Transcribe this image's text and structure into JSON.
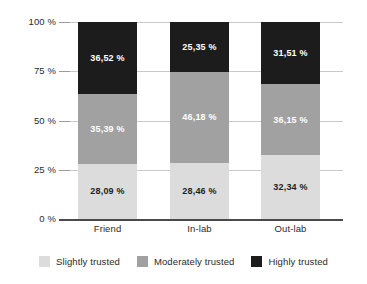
{
  "chart_data": {
    "type": "bar",
    "subtype": "stacked-bar-100-percent",
    "title": "",
    "xlabel": "",
    "ylabel": "",
    "categories": [
      "Friend",
      "In-lab",
      "Out-lab"
    ],
    "ylim": [
      0,
      100
    ],
    "ytick_labels": [
      "100 %",
      "75 %",
      "50 %",
      "25 %",
      "0 %"
    ],
    "ytick_values": [
      100,
      75,
      50,
      25,
      0
    ],
    "grid": true,
    "legend_position": "bottom",
    "series": [
      {
        "name": "Slightly trusted",
        "color": "#dcdcdc",
        "label_color": "#1e1e1e",
        "values": [
          28.09,
          28.46,
          32.34
        ],
        "data_labels": [
          "28,09 %",
          "28,46 %",
          "32,34 %"
        ]
      },
      {
        "name": "Moderately trusted",
        "color": "#a1a1a1",
        "label_color": "#ffffff",
        "values": [
          35.39,
          46.18,
          36.15
        ],
        "data_labels": [
          "35,39 %",
          "46,18 %",
          "36,15 %"
        ]
      },
      {
        "name": "Highly trusted",
        "color": "#1c1c1c",
        "label_color": "#ffffff",
        "values": [
          36.52,
          25.35,
          31.51
        ],
        "data_labels": [
          "36,52 %",
          "25,35 %",
          "31,51 %"
        ]
      }
    ]
  },
  "axis": {
    "ticks": [
      {
        "label": "100 %"
      },
      {
        "label": "75 %"
      },
      {
        "label": "50 %"
      },
      {
        "label": "25 %"
      },
      {
        "label": "0 %"
      }
    ]
  },
  "categories": [
    {
      "label": "Friend"
    },
    {
      "label": "In-lab"
    },
    {
      "label": "Out-lab"
    }
  ],
  "legend": {
    "items": [
      {
        "label": "Slightly trusted",
        "color": "#dcdcdc"
      },
      {
        "label": "Moderately trusted",
        "color": "#a1a1a1"
      },
      {
        "label": "Highly trusted",
        "color": "#1c1c1c"
      }
    ]
  },
  "bars": [
    {
      "category": "Friend",
      "segments": [
        {
          "series": "Highly trusted",
          "label": "36,52 %"
        },
        {
          "series": "Moderately trusted",
          "label": "35,39 %"
        },
        {
          "series": "Slightly trusted",
          "label": "28,09 %"
        }
      ]
    },
    {
      "category": "In-lab",
      "segments": [
        {
          "series": "Highly trusted",
          "label": "25,35 %"
        },
        {
          "series": "Moderately trusted",
          "label": "46,18 %"
        },
        {
          "series": "Slightly trusted",
          "label": "28,46 %"
        }
      ]
    },
    {
      "category": "Out-lab",
      "segments": [
        {
          "series": "Highly trusted",
          "label": "31,51 %"
        },
        {
          "series": "Moderately trusted",
          "label": "36,15 %"
        },
        {
          "series": "Slightly trusted",
          "label": "32,34 %"
        }
      ]
    }
  ]
}
